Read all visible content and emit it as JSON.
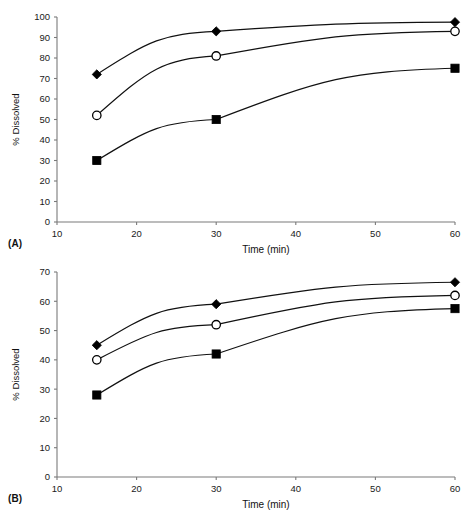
{
  "figure": {
    "panels": [
      {
        "id": "A",
        "label": "(A)",
        "chart_data": {
          "type": "line",
          "title": "",
          "xlabel": "Time (min)",
          "ylabel": "% Dissolved",
          "x": [
            15,
            30,
            60
          ],
          "xlim": [
            10,
            60
          ],
          "ylim": [
            0,
            100
          ],
          "xticks": [
            10,
            20,
            30,
            40,
            50,
            60
          ],
          "yticks": [
            0,
            10,
            20,
            30,
            40,
            50,
            60,
            70,
            80,
            90,
            100
          ],
          "xtick_labels": [
            "10",
            "20",
            "30",
            "40",
            "50",
            "60"
          ],
          "ytick_labels": [
            "0",
            "10",
            "20",
            "30",
            "40",
            "50",
            "60",
            "70",
            "80",
            "90",
            "100"
          ],
          "grid": false,
          "legend": "none",
          "series": [
            {
              "name": "filled-diamond",
              "marker": "filled-diamond",
              "values": [
                72,
                93,
                97.5
              ]
            },
            {
              "name": "open-circle",
              "marker": "open-circle",
              "values": [
                52,
                81,
                93
              ]
            },
            {
              "name": "filled-square",
              "marker": "filled-square",
              "values": [
                30,
                50,
                75
              ]
            }
          ]
        }
      },
      {
        "id": "B",
        "label": "(B)",
        "chart_data": {
          "type": "line",
          "title": "",
          "xlabel": "Time (min)",
          "ylabel": "% Dissolved",
          "x": [
            15,
            30,
            60
          ],
          "xlim": [
            10,
            60
          ],
          "ylim": [
            0,
            70
          ],
          "xticks": [
            10,
            20,
            30,
            40,
            50,
            60
          ],
          "yticks": [
            0,
            10,
            20,
            30,
            40,
            50,
            60,
            70
          ],
          "xtick_labels": [
            "10",
            "20",
            "30",
            "40",
            "50",
            "60"
          ],
          "ytick_labels": [
            "0",
            "10",
            "20",
            "30",
            "40",
            "50",
            "60",
            "70"
          ],
          "grid": false,
          "legend": "none",
          "series": [
            {
              "name": "filled-diamond",
              "marker": "filled-diamond",
              "values": [
                45,
                59,
                66.5
              ]
            },
            {
              "name": "open-circle",
              "marker": "open-circle",
              "values": [
                40,
                52,
                62
              ]
            },
            {
              "name": "filled-square",
              "marker": "filled-square",
              "values": [
                28,
                42,
                57.5
              ]
            }
          ]
        }
      }
    ],
    "colors": {
      "marker_fill": "#000000",
      "marker_open_fill": "#ffffff",
      "line": "#111111",
      "axis": "#7a7a7a",
      "background": "#ffffff"
    }
  }
}
